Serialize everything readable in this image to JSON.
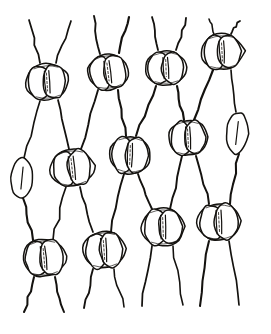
{
  "figure": {
    "title": "Leaf epidermis with paired guard cells at wall junctions",
    "caption": "",
    "style": "hand-drawn-ink-line-art",
    "background_color": "#ffffff",
    "ink_color": "#14120f",
    "canvas": {
      "width": 271,
      "height": 334
    },
    "counts": {
      "stomata_total": 13,
      "full_stomata": 11,
      "single_cells": 2,
      "rows": 3,
      "columns": 4
    },
    "rows": [
      {
        "name": "top-row",
        "label": "Top row of stomata",
        "y": 70,
        "stomata": [
          {
            "name": "stoma-1",
            "cx": 47,
            "cy": 82,
            "rx": 22,
            "ry": 18,
            "rotation": -4,
            "type": "paired"
          },
          {
            "name": "stoma-2",
            "cx": 108,
            "cy": 72,
            "rx": 21,
            "ry": 18,
            "rotation": -7,
            "type": "paired"
          },
          {
            "name": "stoma-3",
            "cx": 166,
            "cy": 68,
            "rx": 21,
            "ry": 17,
            "rotation": -2,
            "type": "paired"
          },
          {
            "name": "stoma-4",
            "cx": 222,
            "cy": 52,
            "rx": 22,
            "ry": 18,
            "rotation": -3,
            "type": "paired"
          }
        ]
      },
      {
        "name": "middle-row",
        "label": "Middle row of stomata",
        "y": 165,
        "stomata": [
          {
            "name": "stoma-5",
            "cx": 22,
            "cy": 178,
            "rx": 11,
            "ry": 20,
            "rotation": 3,
            "type": "single-edge-left"
          },
          {
            "name": "stoma-6",
            "cx": 72,
            "cy": 168,
            "rx": 22,
            "ry": 19,
            "rotation": -6,
            "type": "paired"
          },
          {
            "name": "stoma-7",
            "cx": 130,
            "cy": 155,
            "rx": 21,
            "ry": 19,
            "rotation": 2,
            "type": "paired"
          },
          {
            "name": "stoma-8",
            "cx": 188,
            "cy": 138,
            "rx": 20,
            "ry": 18,
            "rotation": -3,
            "type": "paired"
          },
          {
            "name": "stoma-9",
            "cx": 237,
            "cy": 133,
            "rx": 11,
            "ry": 21,
            "rotation": 4,
            "type": "single"
          }
        ]
      },
      {
        "name": "bottom-row",
        "label": "Bottom row of stomata",
        "y": 255,
        "stomata": [
          {
            "name": "stoma-10",
            "cx": 44,
            "cy": 258,
            "rx": 22,
            "ry": 19,
            "rotation": -5,
            "type": "paired"
          },
          {
            "name": "stoma-11",
            "cx": 104,
            "cy": 250,
            "rx": 21,
            "ry": 19,
            "rotation": -4,
            "type": "paired"
          },
          {
            "name": "stoma-12",
            "cx": 163,
            "cy": 227,
            "rx": 22,
            "ry": 19,
            "rotation": -2,
            "type": "paired"
          },
          {
            "name": "stoma-13",
            "cx": 219,
            "cy": 222,
            "rx": 22,
            "ry": 19,
            "rotation": -3,
            "type": "paired"
          }
        ]
      }
    ],
    "wall_paths": [
      "M 29 20 L 40 63",
      "M 71 21 L 56 63",
      "M 94 16 L 100 54",
      "M 129 17 L 119 53",
      "M 152 17 L 158 50",
      "M 186 18 L 176 50",
      "M 209 19 L 214 34",
      "M 240 21 L 231 34",
      "M 40 101 L 24 158",
      "M 58 100 L 69 149",
      "M 98 90 L 81 149",
      "M 118 90 L 126 136",
      "M 156 86 L 136 136",
      "M 177 86 L 184 120",
      "M 213 70 L 194 120",
      "M 231 70 L 236 112",
      "M 23 198 L 33 240",
      "M 66 187 L 53 240",
      "M 80 187 L 93 232",
      "M 124 174 L 111 232",
      "M 138 174 L 152 209",
      "M 182 156 L 170 209",
      "M 196 156 L 209 204",
      "M 239 154 L 230 204",
      "M 34 277 L 24 312",
      "M 55 277 L 64 312",
      "M 93 269 L 84 308",
      "M 114 269 L 124 307",
      "M 152 246 L 142 306",
      "M 173 246 L 183 305",
      "M 209 241 L 200 306",
      "M 229 241 L 239 305"
    ]
  }
}
